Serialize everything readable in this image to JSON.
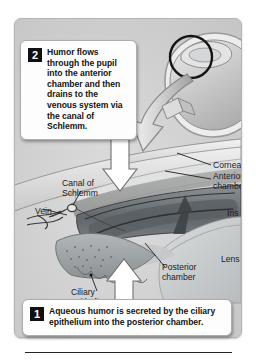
{
  "figure": {
    "title": "Aqueous humor circulation in the anterior eye",
    "alt": "Cutaway medical illustration of the anterior chamber angle of the eye showing aqueous humor flow, with an inset of the whole eye."
  },
  "steps": [
    {
      "number": "1",
      "text": "Aqueous humor is secreted by the ciliary epithelium into the posterior chamber."
    },
    {
      "number": "2",
      "text": "Humor flows through the pupil into the anterior chamber and then drains to the venous system via the canal of Schlemm."
    }
  ],
  "labels": {
    "cornea": "Cornea",
    "anterior_chamber": "Anterior\nchamber",
    "iris": "Iris",
    "lens": "Lens",
    "canal_of_schlemm": "Canal of\nSchlemm",
    "vein": "Vein",
    "ciliary_epithelium": "Ciliary\nepithelium",
    "posterior_chamber": "Posterior\nchamber"
  },
  "colors": {
    "panel_background": "#cfcfcf",
    "callout_background": "#fdfdfd",
    "badge_background": "#101010",
    "badge_text": "#ffffff",
    "label_text": "#1b1b1b",
    "sclera": "#e8e8e8",
    "cornea": "#dcdcdc",
    "iris": "#6f7478",
    "lens": "#c9cccd",
    "ciliary_body": "#9a9fa2",
    "flow_arrow": "#ffffff",
    "outline": "#3a3a3a"
  }
}
